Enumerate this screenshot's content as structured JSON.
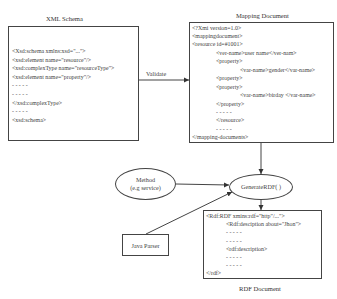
{
  "xml_schema": {
    "title": "XML Schema",
    "lines": [
      {
        "text": "<Xsd:schema xmlns:xsd=\"...\">",
        "indent": 0
      },
      {
        "text": "<xsd:element name=\"resource\"/>",
        "indent": 0
      },
      {
        "text": "<xsd:complexType name=\"resourceType\">",
        "indent": 0
      },
      {
        "text": "<xsd:element name=\"property\"/>",
        "indent": 0
      },
      {
        "text": "- - - - -",
        "indent": 0
      },
      {
        "text": "- - - - -",
        "indent": 0
      },
      {
        "text": "</xsd:complexType>",
        "indent": 0
      },
      {
        "text": "- - - - -",
        "indent": 0
      },
      {
        "text": "<xsd:schema>",
        "indent": 0
      }
    ]
  },
  "validate_arrow": {
    "label": "Validate"
  },
  "mapping_document": {
    "title": "Mapping Document",
    "lines": [
      {
        "text": "<?Xmi version=1.0>",
        "indent": 0
      },
      {
        "text": "<mappingdocument>",
        "indent": 0
      },
      {
        "text": "<resource id=#1001>",
        "indent": 0
      },
      {
        "text": "<ver-name>user name</ver-nam>",
        "indent": 1
      },
      {
        "text": "<property>",
        "indent": 1
      },
      {
        "text": "<var-name>gender</var-name>",
        "indent": 2
      },
      {
        "text": "<property>",
        "indent": 1
      },
      {
        "text": "<property>",
        "indent": 1
      },
      {
        "text": "<var-name>birday </var-name>",
        "indent": 2
      },
      {
        "text": "</property>",
        "indent": 1
      },
      {
        "text": "- - - - -",
        "indent": 1
      },
      {
        "text": "</resource>",
        "indent": 1
      },
      {
        "text": "- - - - -",
        "indent": 1
      },
      {
        "text": "</mapping-documents>",
        "indent": 0
      }
    ]
  },
  "method_node": {
    "line1": "Method",
    "line2": "(e.g service)"
  },
  "generate_node": {
    "label": "GenerateRDF( )"
  },
  "java_parser": {
    "label": "Java Parser"
  },
  "rdf_document": {
    "title": "RDF Document",
    "lines": [
      {
        "text": "<Rdf:RDF xmins:rdf=\"http\"/...\">",
        "indent": 0
      },
      {
        "text": "<Rdf:desciption about=\"Jhon\">",
        "indent": 1
      },
      {
        "text": "- - - - -",
        "indent": 1
      },
      {
        "text": "- - - - -",
        "indent": 1
      },
      {
        "text": "<rdf:description>",
        "indent": 1
      },
      {
        "text": "- - - - -",
        "indent": 1
      },
      {
        "text": "- - - - -",
        "indent": 1
      },
      {
        "text": "</rdf>",
        "indent": 0
      }
    ]
  },
  "colors": {
    "stroke": "#444444",
    "text": "#333333",
    "background": "#ffffff"
  }
}
